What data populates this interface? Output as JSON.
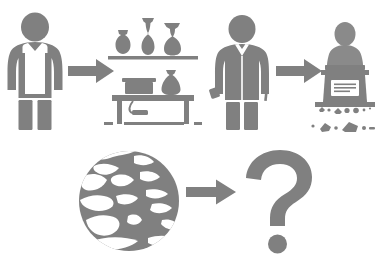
{
  "diagram": {
    "background_color": "#ffffff",
    "glyph_color": "#808080",
    "width": 385,
    "height": 263,
    "style": "grayscale silhouette pictogram",
    "rows": [
      {
        "row_label": "row-1-pottery-and-sculpture",
        "steps": [
          {
            "id": "potter-figure",
            "label": "Potter wearing apron",
            "icon": "person-in-apron-icon"
          },
          {
            "id": "arrow-1",
            "label": "leads to",
            "icon": "arrow-right-icon"
          },
          {
            "id": "pottery-workshop",
            "label": "Pottery workshop with vases on shelf and workbench with kiln",
            "icon": "pottery-workshop-icon"
          },
          {
            "id": "sculptor-figure",
            "label": "Sculptor holding hammer and chisel",
            "icon": "person-with-hammer-icon"
          },
          {
            "id": "arrow-2",
            "label": "leads to",
            "icon": "arrow-right-icon"
          },
          {
            "id": "stone-monument",
            "label": "Carved stone bust on inscribed pedestal with rubble",
            "icon": "stone-bust-monument-icon"
          }
        ]
      },
      {
        "row_label": "row-2-global-outcome",
        "steps": [
          {
            "id": "globe-earth",
            "label": "Globe showing Americas, Europe and Africa",
            "icon": "globe-icon"
          },
          {
            "id": "arrow-3",
            "label": "leads to",
            "icon": "arrow-right-icon"
          },
          {
            "id": "question-mark",
            "label": "Question mark indicating unknown outcome",
            "icon": "question-mark-icon"
          }
        ]
      }
    ],
    "details": {
      "vases_on_shelf_count": 3,
      "vases_on_table_count": 1,
      "monument_plaque_text_lines": 3,
      "rubble_clusters": 2
    }
  }
}
